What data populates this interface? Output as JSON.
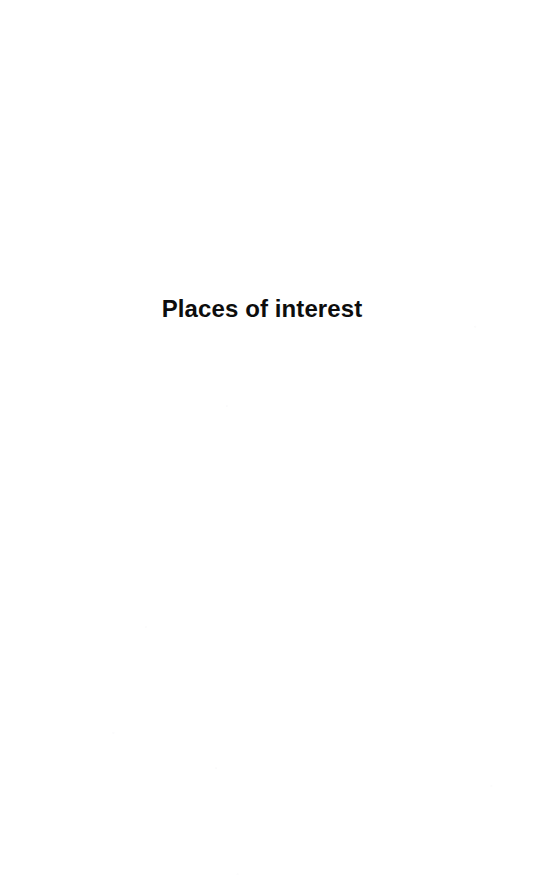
{
  "document": {
    "page_type": "section-divider",
    "background_color": "#ffffff",
    "text_color": "#0d0d0d"
  },
  "section": {
    "title": "Places of interest"
  }
}
